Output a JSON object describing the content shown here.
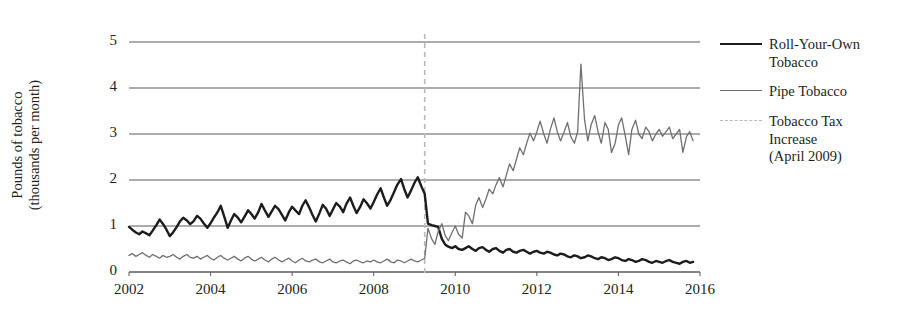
{
  "chart_data": {
    "type": "line",
    "title": "",
    "xlabel": "",
    "ylabel_line1": "Pounds of tobacco",
    "ylabel_line2": "(thousands per month)",
    "xlim": [
      2002,
      2016
    ],
    "ylim": [
      0,
      5
    ],
    "grid": true,
    "legend_position": "right",
    "xticks": [
      "2002",
      "2004",
      "2006",
      "2008",
      "2010",
      "2012",
      "2014",
      "2016"
    ],
    "yticks": [
      "0",
      "1",
      "2",
      "3",
      "4",
      "5"
    ],
    "annotations": [
      {
        "name": "tobacco-tax-increase",
        "label_line1": "Tobacco Tax",
        "label_line2": "Increase",
        "label_line3": "(April 2009)",
        "x": 2009.25,
        "style": "dashed-vertical",
        "color": "#b9b9b9"
      }
    ],
    "series": [
      {
        "name": "Roll-Your-Own Tobacco",
        "legend_line1": "Roll-Your-Own",
        "legend_line2": "Tobacco",
        "color": "#1c1c1c",
        "width": 2.4,
        "x": [
          2002.0,
          2002.08,
          2002.17,
          2002.25,
          2002.33,
          2002.42,
          2002.5,
          2002.58,
          2002.67,
          2002.75,
          2002.83,
          2002.92,
          2003.0,
          2003.08,
          2003.17,
          2003.25,
          2003.33,
          2003.42,
          2003.5,
          2003.58,
          2003.67,
          2003.75,
          2003.83,
          2003.92,
          2004.0,
          2004.08,
          2004.17,
          2004.25,
          2004.33,
          2004.42,
          2004.5,
          2004.58,
          2004.67,
          2004.75,
          2004.83,
          2004.92,
          2005.0,
          2005.08,
          2005.17,
          2005.25,
          2005.33,
          2005.42,
          2005.5,
          2005.58,
          2005.67,
          2005.75,
          2005.83,
          2005.92,
          2006.0,
          2006.08,
          2006.17,
          2006.25,
          2006.33,
          2006.42,
          2006.5,
          2006.58,
          2006.67,
          2006.75,
          2006.83,
          2006.92,
          2007.0,
          2007.08,
          2007.17,
          2007.25,
          2007.33,
          2007.42,
          2007.5,
          2007.58,
          2007.67,
          2007.75,
          2007.83,
          2007.92,
          2008.0,
          2008.08,
          2008.17,
          2008.25,
          2008.33,
          2008.42,
          2008.5,
          2008.58,
          2008.67,
          2008.75,
          2008.83,
          2008.92,
          2009.0,
          2009.08,
          2009.17,
          2009.25,
          2009.33,
          2009.42,
          2009.5,
          2009.58,
          2009.67,
          2009.75,
          2009.83,
          2009.92,
          2010.0,
          2010.08,
          2010.17,
          2010.25,
          2010.33,
          2010.42,
          2010.5,
          2010.58,
          2010.67,
          2010.75,
          2010.83,
          2010.92,
          2011.0,
          2011.08,
          2011.17,
          2011.25,
          2011.33,
          2011.42,
          2011.5,
          2011.58,
          2011.67,
          2011.75,
          2011.83,
          2011.92,
          2012.0,
          2012.08,
          2012.17,
          2012.25,
          2012.33,
          2012.42,
          2012.5,
          2012.58,
          2012.67,
          2012.75,
          2012.83,
          2012.92,
          2013.0,
          2013.08,
          2013.17,
          2013.25,
          2013.33,
          2013.42,
          2013.5,
          2013.58,
          2013.67,
          2013.75,
          2013.83,
          2013.92,
          2014.0,
          2014.08,
          2014.17,
          2014.25,
          2014.33,
          2014.42,
          2014.5,
          2014.58,
          2014.67,
          2014.75,
          2014.83,
          2014.92,
          2015.0,
          2015.08,
          2015.17,
          2015.25,
          2015.33,
          2015.42,
          2015.5,
          2015.58,
          2015.67,
          2015.75,
          2015.83
        ],
        "values": [
          0.98,
          0.92,
          0.86,
          0.82,
          0.88,
          0.84,
          0.8,
          0.9,
          1.02,
          1.14,
          1.05,
          0.92,
          0.78,
          0.86,
          0.98,
          1.1,
          1.18,
          1.12,
          1.04,
          1.1,
          1.22,
          1.16,
          1.06,
          0.96,
          1.06,
          1.18,
          1.3,
          1.44,
          1.22,
          0.96,
          1.12,
          1.26,
          1.18,
          1.08,
          1.2,
          1.34,
          1.26,
          1.16,
          1.3,
          1.48,
          1.34,
          1.2,
          1.32,
          1.44,
          1.36,
          1.24,
          1.12,
          1.3,
          1.42,
          1.34,
          1.26,
          1.44,
          1.56,
          1.4,
          1.24,
          1.1,
          1.28,
          1.46,
          1.38,
          1.22,
          1.36,
          1.5,
          1.42,
          1.3,
          1.48,
          1.62,
          1.44,
          1.28,
          1.42,
          1.58,
          1.5,
          1.38,
          1.52,
          1.68,
          1.82,
          1.62,
          1.44,
          1.58,
          1.74,
          1.9,
          2.02,
          1.8,
          1.62,
          1.78,
          1.94,
          2.06,
          1.86,
          1.7,
          1.05,
          1.02,
          1.0,
          0.98,
          0.72,
          0.6,
          0.55,
          0.52,
          0.56,
          0.5,
          0.48,
          0.52,
          0.56,
          0.5,
          0.46,
          0.52,
          0.54,
          0.48,
          0.44,
          0.5,
          0.52,
          0.46,
          0.42,
          0.48,
          0.5,
          0.44,
          0.42,
          0.46,
          0.48,
          0.44,
          0.4,
          0.44,
          0.46,
          0.42,
          0.4,
          0.44,
          0.42,
          0.38,
          0.36,
          0.4,
          0.38,
          0.34,
          0.32,
          0.36,
          0.34,
          0.3,
          0.32,
          0.36,
          0.34,
          0.3,
          0.28,
          0.32,
          0.3,
          0.26,
          0.28,
          0.32,
          0.3,
          0.26,
          0.24,
          0.28,
          0.26,
          0.22,
          0.24,
          0.28,
          0.26,
          0.22,
          0.2,
          0.24,
          0.22,
          0.2,
          0.24,
          0.26,
          0.22,
          0.2,
          0.18,
          0.22,
          0.24,
          0.2,
          0.22
        ]
      },
      {
        "name": "Pipe Tobacco",
        "legend_line1": "Pipe Tobacco",
        "legend_line2": "",
        "color": "#6f6f6f",
        "width": 1.3,
        "x": [
          2002.0,
          2002.08,
          2002.17,
          2002.25,
          2002.33,
          2002.42,
          2002.5,
          2002.58,
          2002.67,
          2002.75,
          2002.83,
          2002.92,
          2003.0,
          2003.08,
          2003.17,
          2003.25,
          2003.33,
          2003.42,
          2003.5,
          2003.58,
          2003.67,
          2003.75,
          2003.83,
          2003.92,
          2004.0,
          2004.08,
          2004.17,
          2004.25,
          2004.33,
          2004.42,
          2004.5,
          2004.58,
          2004.67,
          2004.75,
          2004.83,
          2004.92,
          2005.0,
          2005.08,
          2005.17,
          2005.25,
          2005.33,
          2005.42,
          2005.5,
          2005.58,
          2005.67,
          2005.75,
          2005.83,
          2005.92,
          2006.0,
          2006.08,
          2006.17,
          2006.25,
          2006.33,
          2006.42,
          2006.5,
          2006.58,
          2006.67,
          2006.75,
          2006.83,
          2006.92,
          2007.0,
          2007.08,
          2007.17,
          2007.25,
          2007.33,
          2007.42,
          2007.5,
          2007.58,
          2007.67,
          2007.75,
          2007.83,
          2007.92,
          2008.0,
          2008.08,
          2008.17,
          2008.25,
          2008.33,
          2008.42,
          2008.5,
          2008.58,
          2008.67,
          2008.75,
          2008.83,
          2008.92,
          2009.0,
          2009.08,
          2009.17,
          2009.25,
          2009.33,
          2009.42,
          2009.5,
          2009.58,
          2009.67,
          2009.75,
          2009.83,
          2009.92,
          2010.0,
          2010.08,
          2010.17,
          2010.25,
          2010.33,
          2010.42,
          2010.5,
          2010.58,
          2010.67,
          2010.75,
          2010.83,
          2010.92,
          2011.0,
          2011.08,
          2011.17,
          2011.25,
          2011.33,
          2011.42,
          2011.5,
          2011.58,
          2011.67,
          2011.75,
          2011.83,
          2011.92,
          2012.0,
          2012.08,
          2012.17,
          2012.25,
          2012.33,
          2012.42,
          2012.5,
          2012.58,
          2012.67,
          2012.75,
          2012.83,
          2012.92,
          2013.0,
          2013.08,
          2013.17,
          2013.25,
          2013.33,
          2013.42,
          2013.5,
          2013.58,
          2013.67,
          2013.75,
          2013.83,
          2013.92,
          2014.0,
          2014.08,
          2014.17,
          2014.25,
          2014.33,
          2014.42,
          2014.5,
          2014.58,
          2014.67,
          2014.75,
          2014.83,
          2014.92,
          2015.0,
          2015.08,
          2015.17,
          2015.25,
          2015.33,
          2015.42,
          2015.5,
          2015.58,
          2015.67,
          2015.75,
          2015.83
        ],
        "values": [
          0.36,
          0.4,
          0.34,
          0.38,
          0.42,
          0.36,
          0.32,
          0.38,
          0.34,
          0.3,
          0.36,
          0.32,
          0.34,
          0.38,
          0.32,
          0.28,
          0.34,
          0.38,
          0.32,
          0.3,
          0.34,
          0.28,
          0.32,
          0.36,
          0.3,
          0.26,
          0.32,
          0.36,
          0.3,
          0.26,
          0.3,
          0.34,
          0.28,
          0.24,
          0.3,
          0.34,
          0.28,
          0.24,
          0.28,
          0.32,
          0.26,
          0.22,
          0.28,
          0.32,
          0.26,
          0.22,
          0.26,
          0.3,
          0.24,
          0.2,
          0.26,
          0.3,
          0.24,
          0.22,
          0.26,
          0.28,
          0.22,
          0.2,
          0.24,
          0.28,
          0.22,
          0.2,
          0.24,
          0.26,
          0.22,
          0.18,
          0.24,
          0.26,
          0.22,
          0.2,
          0.24,
          0.22,
          0.26,
          0.22,
          0.2,
          0.24,
          0.28,
          0.22,
          0.2,
          0.26,
          0.24,
          0.2,
          0.24,
          0.28,
          0.24,
          0.22,
          0.26,
          0.3,
          0.95,
          0.72,
          0.6,
          0.88,
          1.05,
          0.8,
          0.68,
          0.86,
          1.0,
          0.82,
          0.74,
          1.3,
          1.22,
          1.05,
          1.45,
          1.62,
          1.4,
          1.58,
          1.8,
          1.7,
          1.9,
          2.05,
          1.85,
          2.1,
          2.35,
          2.2,
          2.45,
          2.7,
          2.55,
          2.8,
          3.02,
          2.85,
          3.05,
          3.28,
          3.0,
          2.8,
          3.1,
          3.35,
          3.05,
          2.85,
          3.05,
          3.25,
          2.95,
          2.8,
          3.05,
          4.52,
          3.3,
          2.85,
          3.2,
          3.4,
          3.05,
          2.8,
          3.25,
          3.1,
          2.6,
          2.8,
          3.2,
          3.35,
          2.95,
          2.55,
          3.1,
          3.3,
          3.0,
          2.9,
          3.15,
          3.05,
          2.85,
          3.0,
          3.1,
          2.95,
          3.05,
          3.15,
          2.9,
          3.0,
          3.1,
          2.6,
          2.95,
          3.05,
          2.85
        ]
      }
    ]
  }
}
